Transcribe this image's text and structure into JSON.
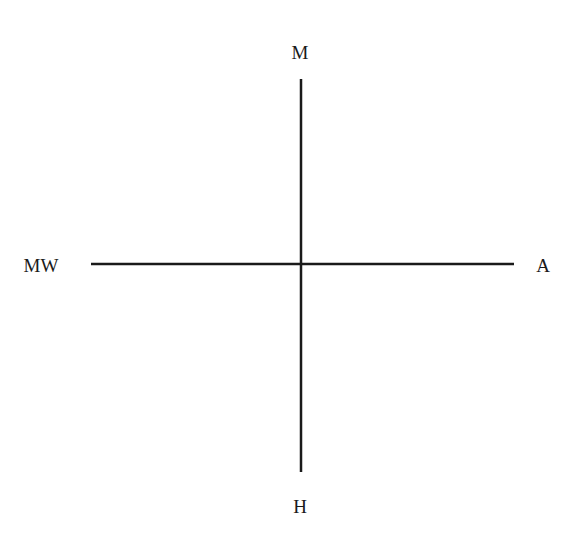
{
  "diagram": {
    "type": "cross-axes",
    "axes": {
      "vertical": {
        "top_label": "M",
        "bottom_label": "H"
      },
      "horizontal": {
        "left_label": "MW",
        "right_label": "A"
      }
    },
    "colors": {
      "line": "#1a1a1a",
      "text": "#1a1a1a",
      "background": "#ffffff"
    }
  }
}
